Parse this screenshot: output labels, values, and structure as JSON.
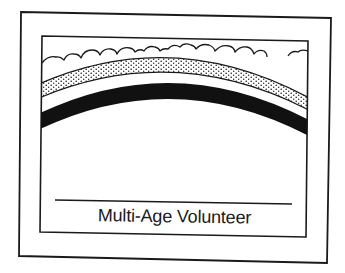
{
  "certificate": {
    "caption": "Multi-Age Volunteer",
    "ink_color": "#1a1a1a",
    "background_color": "#ffffff",
    "illustration": {
      "elements": [
        "clouds",
        "dotted-rainbow-band",
        "solid-black-rainbow-band"
      ]
    },
    "signature_line": true
  }
}
